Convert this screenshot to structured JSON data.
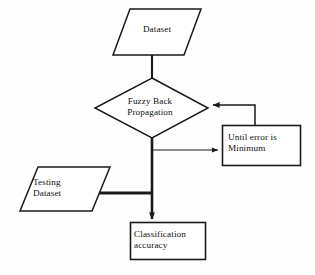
{
  "diagram": {
    "background_color": "#fefefe",
    "stroke_color": "#1a1a1a",
    "text_color": "#111111",
    "nodes": [
      {
        "id": "dataset",
        "shape": "parallelogram",
        "label_line1": "Dataset",
        "label_line2": ""
      },
      {
        "id": "fuzzy_back_propagation",
        "shape": "diamond",
        "label_line1": "Fuzzy Back",
        "label_line2": "Propagation"
      },
      {
        "id": "until_error_minimum",
        "shape": "rectangle",
        "label_line1": "Until error is",
        "label_line2": "Minimum"
      },
      {
        "id": "testing_dataset",
        "shape": "parallelogram",
        "label_line1": "Testing",
        "label_line2": "Dataset"
      },
      {
        "id": "classification_accuracy",
        "shape": "rectangle",
        "label_line1": "Classification",
        "label_line2": "accuracy"
      }
    ],
    "edges": [
      {
        "id": "dataset-to-fuzzy",
        "from": "dataset",
        "to": "fuzzy_back_propagation",
        "arrow": false,
        "weight": "thin"
      },
      {
        "id": "fuzzy-to-until",
        "from": "fuzzy_back_propagation",
        "to": "until_error_minimum",
        "arrow": true,
        "weight": "thin"
      },
      {
        "id": "until-to-fuzzy-feedback",
        "from": "until_error_minimum",
        "to": "fuzzy_back_propagation",
        "arrow": true,
        "weight": "thin"
      },
      {
        "id": "testing-to-stem",
        "from": "testing_dataset",
        "to": "classification_accuracy",
        "arrow": false,
        "weight": "thick"
      },
      {
        "id": "fuzzy-to-classification",
        "from": "fuzzy_back_propagation",
        "to": "classification_accuracy",
        "arrow": true,
        "weight": "thick"
      }
    ]
  }
}
